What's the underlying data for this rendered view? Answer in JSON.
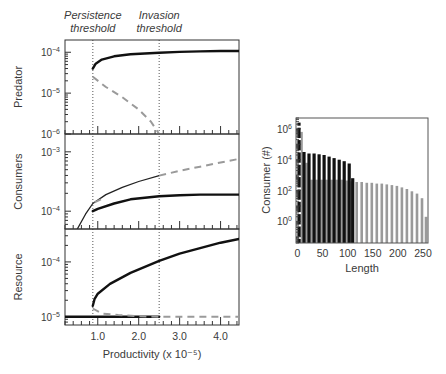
{
  "chart_data": [
    {
      "type": "line",
      "title": "",
      "xlabel": "Productivity (x 10⁻⁵)",
      "x_ticks": [
        "1.0",
        "2.0",
        "3.0",
        "4.0"
      ],
      "x_tick_values": [
        1.0,
        2.0,
        3.0,
        4.0
      ],
      "xlim": [
        0.2,
        4.45
      ],
      "annotations": [
        {
          "text_line1": "Persistence",
          "text_line2": "threshold",
          "x": 0.88
        },
        {
          "text_line1": "Invasion",
          "text_line2": "threshold",
          "x": 2.5
        }
      ],
      "panels": [
        {
          "ylabel": "Predator",
          "yscale": "log",
          "ylim_exp": [
            -6.0,
            -3.7
          ],
          "y_ticks": [
            {
              "label": "10",
              "exp": "−4",
              "value_exp": -4
            },
            {
              "label": "10",
              "exp": "−5",
              "value_exp": -5
            },
            {
              "label": "10",
              "exp": "−6",
              "value_exp": -6
            }
          ],
          "series": [
            {
              "name": "stable",
              "style": "solid-black",
              "x": [
                0.88,
                0.95,
                1.1,
                1.4,
                1.8,
                2.5,
                3.0,
                3.5,
                4.0,
                4.45
              ],
              "y_exp": [
                -4.4,
                -4.28,
                -4.18,
                -4.1,
                -4.05,
                -4.01,
                -3.99,
                -3.98,
                -3.97,
                -3.97
              ]
            },
            {
              "name": "unstable",
              "style": "dashed-gray",
              "x": [
                0.88,
                1.2,
                1.6,
                2.0,
                2.3,
                2.5
              ],
              "y_exp": [
                -4.6,
                -4.85,
                -5.1,
                -5.4,
                -5.7,
                -6.0
              ]
            }
          ]
        },
        {
          "ylabel": "Consumers",
          "yscale": "log",
          "ylim_exp": [
            -4.3,
            -2.7
          ],
          "y_ticks": [
            {
              "label": "10",
              "exp": "−3",
              "value_exp": -3
            },
            {
              "label": "10",
              "exp": "−4",
              "value_exp": -4
            }
          ],
          "series": [
            {
              "name": "total-before-invasion",
              "style": "solid-thin-black",
              "x": [
                0.5,
                0.7,
                0.88,
                1.2,
                1.6,
                2.0,
                2.5
              ],
              "y_exp": [
                -4.3,
                -4.05,
                -3.87,
                -3.72,
                -3.6,
                -3.5,
                -3.4
              ]
            },
            {
              "name": "total-after-invasion",
              "style": "dashed-gray",
              "x": [
                2.5,
                3.0,
                3.5,
                4.0,
                4.45
              ],
              "y_exp": [
                -3.4,
                -3.32,
                -3.25,
                -3.18,
                -3.12
              ]
            },
            {
              "name": "stable",
              "style": "solid-black",
              "x": [
                0.88,
                1.0,
                1.4,
                1.8,
                2.5,
                3.0,
                3.5,
                4.0,
                4.45
              ],
              "y_exp": [
                -4.0,
                -3.96,
                -3.87,
                -3.8,
                -3.75,
                -3.73,
                -3.72,
                -3.72,
                -3.72
              ]
            },
            {
              "name": "gray-short",
              "style": "dashed-gray",
              "x": [
                0.92,
                1.15
              ],
              "y_exp": [
                -3.85,
                -3.78
              ]
            }
          ]
        },
        {
          "ylabel": "Resource",
          "yscale": "log",
          "ylim_exp": [
            -5.15,
            -3.4
          ],
          "y_ticks": [
            {
              "label": "10",
              "exp": "−4",
              "value_exp": -4
            },
            {
              "label": "10",
              "exp": "−5",
              "value_exp": -5
            }
          ],
          "series": [
            {
              "name": "stable-upper",
              "style": "solid-black",
              "x": [
                0.88,
                0.92,
                1.0,
                1.3,
                1.8,
                2.5,
                3.0,
                3.5,
                4.0,
                4.45
              ],
              "y_exp": [
                -4.8,
                -4.68,
                -4.58,
                -4.4,
                -4.2,
                -3.98,
                -3.85,
                -3.75,
                -3.65,
                -3.58
              ]
            },
            {
              "name": "stable-lower",
              "style": "solid-black",
              "x": [
                0.2,
                2.5
              ],
              "y_exp": [
                -5.0,
                -5.0
              ]
            },
            {
              "name": "unstable-lower",
              "style": "dashed-gray",
              "x": [
                0.88,
                1.1,
                1.5,
                2.0,
                2.5,
                4.45
              ],
              "y_exp": [
                -4.85,
                -4.94,
                -4.97,
                -4.99,
                -5.0,
                -5.0
              ]
            }
          ]
        }
      ],
      "legend": null,
      "grid": false
    },
    {
      "type": "bar",
      "title": "",
      "xlabel": "Length",
      "ylabel": "Consumer (#)",
      "x_ticks": [
        "0",
        "50",
        "100",
        "150",
        "200",
        "250"
      ],
      "x_tick_values": [
        0,
        50,
        100,
        150,
        200,
        250
      ],
      "xlim": [
        -3,
        260
      ],
      "yscale": "log",
      "ylim_exp": [
        -1.4,
        6.7
      ],
      "y_ticks": [
        {
          "label": "10",
          "exp": "6",
          "value_exp": 6
        },
        {
          "label": "10",
          "exp": "4",
          "value_exp": 4
        },
        {
          "label": "10",
          "exp": "2",
          "value_exp": 2
        },
        {
          "label": "10",
          "exp": "0",
          "value_exp": 0
        }
      ],
      "series": [
        {
          "name": "gray",
          "color": "#9a9a9a",
          "x": [
            8,
            18,
            28,
            38,
            48,
            58,
            68,
            78,
            88,
            98,
            108,
            118,
            128,
            138,
            148,
            158,
            168,
            178,
            188,
            198,
            208,
            218,
            228,
            238,
            248,
            256
          ],
          "y_exp": [
            5.8,
            3.8,
            2.7,
            2.7,
            2.7,
            2.7,
            2.7,
            2.7,
            2.7,
            2.65,
            2.6,
            2.55,
            2.55,
            2.5,
            2.5,
            2.45,
            2.45,
            2.4,
            2.35,
            2.3,
            2.2,
            2.1,
            1.95,
            1.8,
            1.5,
            0.3
          ]
        },
        {
          "name": "black",
          "color": "#111111",
          "x": [
            3,
            13,
            23,
            33,
            43,
            53,
            63,
            73,
            83,
            93,
            103,
            110
          ],
          "y_exp": [
            6.4,
            4.5,
            4.4,
            4.4,
            4.35,
            4.3,
            4.2,
            4.1,
            4.0,
            3.9,
            3.75,
            2.8
          ]
        }
      ],
      "legend": null,
      "grid": false
    }
  ]
}
